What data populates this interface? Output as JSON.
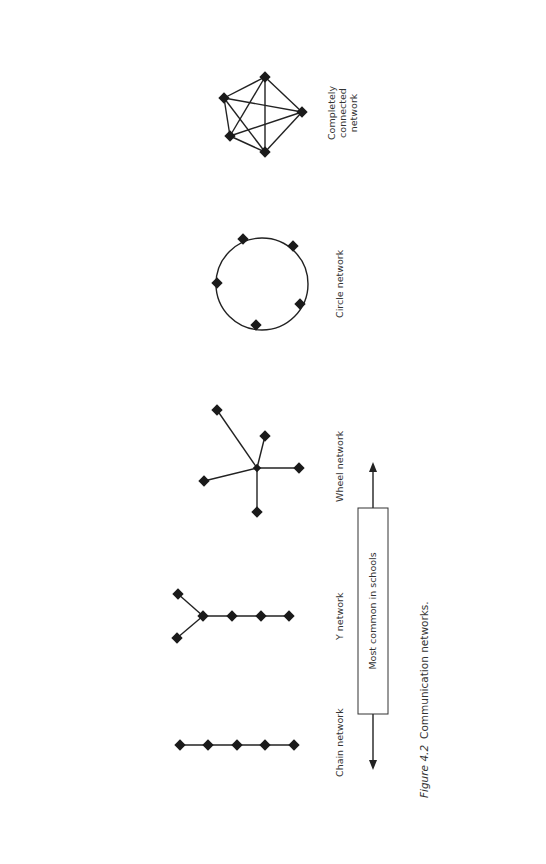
{
  "figure": {
    "caption_prefix": "Figure 4.2",
    "caption_text": "Communication networks.",
    "orientation": "rotated -90deg (landscape figure on portrait page)"
  },
  "networks": [
    {
      "id": "chain",
      "label": "Chain network",
      "nodes": 5,
      "node_positions": [
        [
          180,
          745
        ],
        [
          208,
          745
        ],
        [
          237,
          745
        ],
        [
          265,
          745
        ],
        [
          294,
          745
        ]
      ],
      "edges": [
        [
          0,
          1
        ],
        [
          1,
          2
        ],
        [
          2,
          3
        ],
        [
          3,
          4
        ]
      ]
    },
    {
      "id": "y",
      "label": "Y network",
      "nodes": 6,
      "node_positions": [
        [
          178,
          594
        ],
        [
          177,
          638
        ],
        [
          203,
          616
        ],
        [
          232,
          616
        ],
        [
          261,
          616
        ],
        [
          289,
          616
        ]
      ],
      "edges": [
        [
          0,
          2
        ],
        [
          1,
          2
        ],
        [
          2,
          3
        ],
        [
          3,
          4
        ],
        [
          4,
          5
        ]
      ]
    },
    {
      "id": "wheel",
      "label": "Wheel network",
      "nodes": 6,
      "node_positions": [
        [
          257,
          468
        ],
        [
          217,
          410
        ],
        [
          265,
          436
        ],
        [
          299,
          468
        ],
        [
          204,
          481
        ],
        [
          257,
          512
        ]
      ],
      "edges": [
        [
          0,
          1
        ],
        [
          0,
          2
        ],
        [
          0,
          3
        ],
        [
          0,
          4
        ],
        [
          0,
          5
        ]
      ]
    },
    {
      "id": "circle",
      "label": "Circle network",
      "nodes": 5,
      "center": [
        262,
        284
      ],
      "radius": 46,
      "node_positions": [
        [
          243,
          239
        ],
        [
          293,
          246
        ],
        [
          300,
          304
        ],
        [
          256,
          325
        ],
        [
          217,
          283
        ]
      ]
    },
    {
      "id": "complete",
      "label_lines": [
        "Completely",
        "connected",
        "network"
      ],
      "nodes": 5,
      "node_positions": [
        [
          265,
          77
        ],
        [
          224,
          98
        ],
        [
          230,
          136
        ],
        [
          265,
          152
        ],
        [
          302,
          112
        ]
      ],
      "edges": [
        [
          0,
          1
        ],
        [
          0,
          2
        ],
        [
          0,
          3
        ],
        [
          0,
          4
        ],
        [
          1,
          2
        ],
        [
          1,
          3
        ],
        [
          1,
          4
        ],
        [
          2,
          3
        ],
        [
          2,
          4
        ],
        [
          3,
          4
        ]
      ]
    }
  ],
  "range_box": {
    "label": "Most common in schools",
    "spans": "Chain network to Wheel network",
    "arrows": "double-headed"
  }
}
